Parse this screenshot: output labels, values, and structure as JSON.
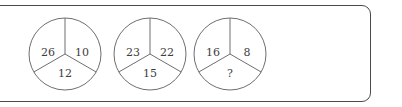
{
  "panel": {
    "border_color": "#4a4a4a",
    "background_color": "#ffffff"
  },
  "figure_style": {
    "stroke_color": "#6e6e6e",
    "text_color": "#3d3d3d"
  },
  "puzzle": {
    "circles": [
      {
        "name": "circle-1",
        "left": "28px",
        "segments": {
          "upper_left": "26",
          "upper_right": "10",
          "bottom": "12"
        }
      },
      {
        "name": "circle-2",
        "left": "113px",
        "segments": {
          "upper_left": "23",
          "upper_right": "22",
          "bottom": "15"
        }
      },
      {
        "name": "circle-3",
        "left": "193px",
        "segments": {
          "upper_left": "16",
          "upper_right": "8",
          "bottom": "?"
        }
      }
    ]
  }
}
